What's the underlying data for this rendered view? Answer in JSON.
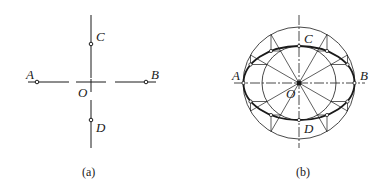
{
  "figure_a": {
    "caption": "(a)",
    "labels": {
      "A": "A",
      "B": "B",
      "C": "C",
      "D": "D",
      "O": "O"
    }
  },
  "figure_b": {
    "caption": "(b)",
    "labels": {
      "A": "A",
      "B": "B",
      "C": "C",
      "D": "D",
      "O": "O"
    }
  },
  "colors": {
    "stroke": "#1a1a1a",
    "background": "#ffffff"
  }
}
